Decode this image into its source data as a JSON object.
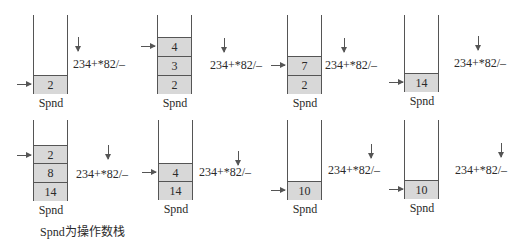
{
  "expression": "234+*82/–",
  "stack_label": "Spnd",
  "caption": "Spnd为操作数栈",
  "panels": [
    {
      "cells": [
        "2"
      ],
      "top_index": 0
    },
    {
      "cells": [
        "4",
        "3",
        "2"
      ],
      "top_index": 0
    },
    {
      "cells": [
        "7",
        "2"
      ],
      "top_index": 0
    },
    {
      "cells": [
        "14"
      ],
      "top_index": 0
    },
    {
      "cells": [
        "2",
        "8",
        "14"
      ],
      "top_index": 0
    },
    {
      "cells": [
        "4",
        "14"
      ],
      "top_index": 0
    },
    {
      "cells": [
        "10"
      ],
      "top_index": 0
    },
    {
      "cells": [
        "10"
      ],
      "top_index": 0
    }
  ]
}
